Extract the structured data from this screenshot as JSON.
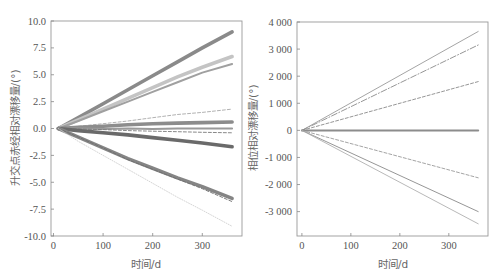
{
  "chart_data": [
    {
      "type": "line",
      "title": "",
      "xlabel": "时间/d",
      "ylabel": "升交点赤经相对漂移量/(°)",
      "xlim": [
        -5,
        380
      ],
      "ylim": [
        -10,
        10
      ],
      "xticks": [
        0,
        100,
        200,
        300
      ],
      "xtick_labels": [
        "0",
        "100",
        "200",
        "300"
      ],
      "yticks": [
        10,
        7.5,
        5,
        2.5,
        0,
        -2.5,
        -5,
        -7.5,
        -10
      ],
      "ytick_labels": [
        "10.0",
        "7.5",
        "5.0",
        "2.5",
        "0.0",
        "-2.5",
        "-5.0",
        "-7.5",
        "-10.0"
      ],
      "grid": false,
      "legend": "none",
      "x": [
        10,
        50,
        100,
        150,
        200,
        250,
        300,
        360
      ],
      "series": [
        {
          "name": "s1",
          "color": "#8a8a8a",
          "style": "solid",
          "weight": "thick",
          "values": [
            0,
            1.0,
            2.3,
            3.6,
            4.9,
            6.2,
            7.5,
            9.0
          ]
        },
        {
          "name": "s2",
          "color": "#c4c4c4",
          "style": "solid",
          "weight": "thick",
          "values": [
            0,
            0.8,
            1.8,
            2.8,
            3.8,
            4.8,
            5.7,
            6.7
          ]
        },
        {
          "name": "s3",
          "color": "#a0a0a0",
          "style": "solid",
          "weight": "medium",
          "values": [
            0,
            0.7,
            1.6,
            2.5,
            3.4,
            4.3,
            5.2,
            6.0
          ]
        },
        {
          "name": "s4",
          "color": "#a8a8a8",
          "style": "dashed",
          "weight": "thin",
          "values": [
            0,
            0.2,
            0.45,
            0.7,
            1.0,
            1.3,
            1.5,
            1.8
          ]
        },
        {
          "name": "s5",
          "color": "#8c8c8c",
          "style": "solid",
          "weight": "thick",
          "values": [
            0,
            0.1,
            0.2,
            0.35,
            0.45,
            0.5,
            0.55,
            0.6
          ]
        },
        {
          "name": "s6",
          "color": "#9a9a9a",
          "style": "solid",
          "weight": "medium",
          "values": [
            0,
            0,
            -0.05,
            0,
            -0.05,
            0,
            0,
            0
          ]
        },
        {
          "name": "s7",
          "color": "#7a7a7a",
          "style": "dashed",
          "weight": "thin",
          "values": [
            0,
            -0.05,
            -0.1,
            -0.2,
            -0.25,
            -0.3,
            -0.35,
            -0.4
          ]
        },
        {
          "name": "s8",
          "color": "#6a6a6a",
          "style": "solid",
          "weight": "thick",
          "values": [
            0,
            -0.2,
            -0.4,
            -0.6,
            -0.85,
            -1.1,
            -1.35,
            -1.7
          ]
        },
        {
          "name": "s9",
          "color": "#858585",
          "style": "solid",
          "weight": "thick",
          "values": [
            0,
            -0.8,
            -1.8,
            -2.8,
            -3.7,
            -4.6,
            -5.4,
            -6.5
          ]
        },
        {
          "name": "s10",
          "color": "#6e6e6e",
          "style": "dashed",
          "weight": "thin",
          "values": [
            0,
            -0.8,
            -1.8,
            -2.9,
            -3.8,
            -4.7,
            -5.6,
            -6.8
          ]
        },
        {
          "name": "s11",
          "color": "#d0d0d0",
          "style": "dotted",
          "weight": "thin",
          "values": [
            0,
            -1.2,
            -2.5,
            -3.8,
            -5.1,
            -6.4,
            -7.6,
            -9.1
          ]
        }
      ]
    },
    {
      "type": "line",
      "title": "",
      "xlabel": "时间/d",
      "ylabel": "相位相对漂移量/(°)",
      "xlim": [
        -10,
        380
      ],
      "ylim": [
        -3900,
        4000
      ],
      "xticks": [
        0,
        100,
        200,
        300
      ],
      "xtick_labels": [
        "0",
        "100",
        "200",
        "300"
      ],
      "yticks": [
        4000,
        3000,
        2000,
        1000,
        0,
        -1000,
        -2000,
        -3000
      ],
      "ytick_labels": [
        "4 000",
        "3 000",
        "2 000",
        "1 000",
        "0",
        "-1 000",
        "-2 000",
        "-3 000"
      ],
      "grid": false,
      "legend": "none",
      "x": [
        0,
        360
      ],
      "series": [
        {
          "name": "p1",
          "color": "#9a9a9a",
          "style": "solid",
          "weight": "thin",
          "values": [
            0,
            3650
          ]
        },
        {
          "name": "p2",
          "color": "#8a8a8a",
          "style": "dashdot",
          "weight": "thin",
          "values": [
            0,
            3150
          ]
        },
        {
          "name": "p3",
          "color": "#8a8a8a",
          "style": "dashed",
          "weight": "thin",
          "values": [
            0,
            1800
          ]
        },
        {
          "name": "p4",
          "color": "#8c8c8c",
          "style": "solid",
          "weight": "medium",
          "values": [
            0,
            0
          ]
        },
        {
          "name": "p5",
          "color": "#9a9a9a",
          "style": "dashed",
          "weight": "thin",
          "values": [
            0,
            -1750
          ]
        },
        {
          "name": "p6",
          "color": "#8a8a8a",
          "style": "solid",
          "weight": "thin",
          "values": [
            0,
            -3000
          ]
        },
        {
          "name": "p7",
          "color": "#b0b0b0",
          "style": "solid",
          "weight": "thin",
          "values": [
            0,
            -3450
          ]
        }
      ]
    }
  ]
}
